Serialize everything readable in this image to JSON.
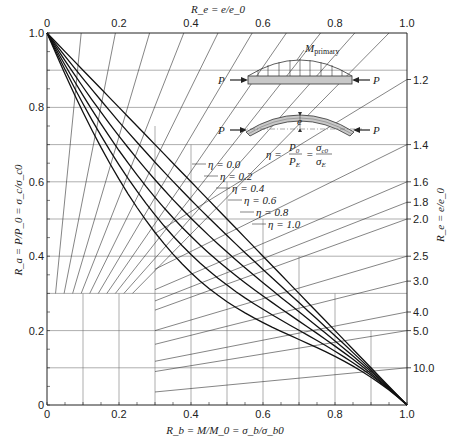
{
  "chart_data": {
    "type": "line",
    "title": "",
    "xlabel": "R_b = M/M_0 = σ_b/σ_b0",
    "ylabel": "R_a = P/P_0 = σ_c/σ_c0",
    "top_axis_label": "R_e = e/e_0",
    "right_axis_label": "R_e = e/e_0",
    "xlim": [
      0,
      1.0
    ],
    "ylim": [
      0,
      1.0
    ],
    "x_ticks": [
      "0",
      "0.2",
      "0.4",
      "0.6",
      "0.8",
      "1.0"
    ],
    "y_ticks": [
      "0",
      "0.2",
      "0.4",
      "0.6",
      "0.8",
      "1.0"
    ],
    "top_ticks": [
      "0",
      "0.2",
      "0.4",
      "0.6",
      "0.8",
      "1.0"
    ],
    "right_ticks": [
      {
        "label": "1.2",
        "y": 0.875
      },
      {
        "label": "1.4",
        "y": 0.7
      },
      {
        "label": "1.6",
        "y": 0.6
      },
      {
        "label": "1.8",
        "y": 0.545
      },
      {
        "label": "2.0",
        "y": 0.5
      },
      {
        "label": "2.5",
        "y": 0.4
      },
      {
        "label": "3.0",
        "y": 0.333
      },
      {
        "label": "4.0",
        "y": 0.25
      },
      {
        "label": "5.0",
        "y": 0.2
      },
      {
        "label": "10.0",
        "y": 0.1
      }
    ],
    "grid": true,
    "legend_position": "inline annotations",
    "series": [
      {
        "name": "η = 0.0",
        "eta": 0.0,
        "x": [
          0,
          0.2,
          0.4,
          0.6,
          0.8,
          1.0
        ],
        "y": [
          1.0,
          0.8,
          0.6,
          0.4,
          0.2,
          0.0
        ]
      },
      {
        "name": "η = 0.2",
        "eta": 0.2,
        "x": [
          0,
          0.2,
          0.4,
          0.6,
          0.8,
          1.0
        ],
        "y": [
          1.0,
          0.77,
          0.56,
          0.37,
          0.18,
          0.0
        ]
      },
      {
        "name": "η = 0.4",
        "eta": 0.4,
        "x": [
          0,
          0.2,
          0.4,
          0.6,
          0.8,
          1.0
        ],
        "y": [
          1.0,
          0.73,
          0.52,
          0.33,
          0.16,
          0.0
        ]
      },
      {
        "name": "η = 0.6",
        "eta": 0.6,
        "x": [
          0,
          0.2,
          0.4,
          0.6,
          0.8,
          1.0
        ],
        "y": [
          1.0,
          0.69,
          0.47,
          0.29,
          0.14,
          0.0
        ]
      },
      {
        "name": "η = 0.8",
        "eta": 0.8,
        "x": [
          0,
          0.2,
          0.4,
          0.6,
          0.8,
          1.0
        ],
        "y": [
          1.0,
          0.64,
          0.42,
          0.26,
          0.12,
          0.0
        ]
      },
      {
        "name": "η = 1.0",
        "eta": 1.0,
        "x": [
          0,
          0.2,
          0.4,
          0.6,
          0.8,
          1.0
        ],
        "y": [
          1.0,
          0.58,
          0.37,
          0.22,
          0.1,
          0.0
        ]
      }
    ],
    "annotations": {
      "diagram_labels": [
        "M_primary",
        "P",
        "P",
        "P",
        "P",
        "e"
      ],
      "formula": "η = P_0/P_E = σ_c0/σ_E"
    }
  },
  "labels": {
    "top_axis": "R_e = e/e_0",
    "right_axis": "R_e = e/e_0",
    "x_axis": "R_b = M/M_0 = σ_b/σ_b0",
    "y_axis": "R_a = P/P_0 = σ_c/σ_c0",
    "m_primary": "M",
    "m_primary_sub": "primary",
    "p_label": "P",
    "e_label": "e",
    "formula_eta": "η =",
    "formula_p0": "P",
    "formula_pe": "P",
    "formula_sc0": "σ",
    "formula_se": "σ",
    "caption": "Figure 10.13  Interaction curves for beam-columns"
  }
}
